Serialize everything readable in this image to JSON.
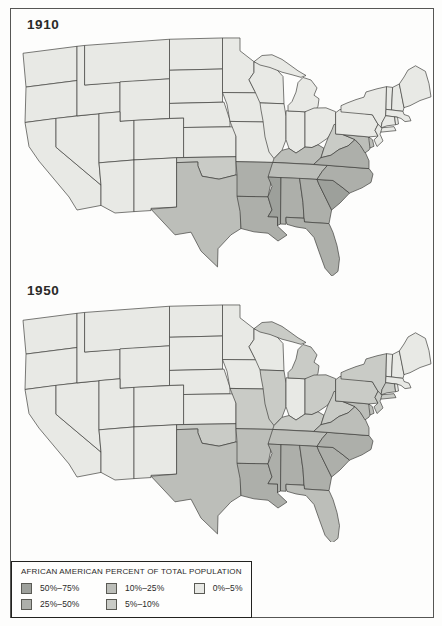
{
  "figure": {
    "type": "choropleth-map-pair",
    "region": "contiguous United States"
  },
  "colors": {
    "c50_75": "#9da09b",
    "c25_50": "#adafaa",
    "c10_25": "#bcbeb9",
    "c5_10": "#c9cbc6",
    "c0_5": "#e8e9e5",
    "border": "#3b3b39",
    "frame": "#565654",
    "background": "#fdfdfc"
  },
  "legend": {
    "title": "AFRICAN AMERICAN PERCENT OF TOTAL POPULATION",
    "items": [
      {
        "label": "50%–75%",
        "category": "c50_75"
      },
      {
        "label": "25%–50%",
        "category": "c25_50"
      },
      {
        "label": "10%–25%",
        "category": "c10_25"
      },
      {
        "label": "5%–10%",
        "category": "c5_10"
      },
      {
        "label": "0%–5%",
        "category": "c0_5"
      }
    ]
  },
  "maps": [
    {
      "id": "m1910",
      "year": "1910",
      "default_category": "c0_5",
      "state_categories": {
        "MS": "c50_75",
        "SC": "c50_75",
        "LA": "c25_50",
        "AL": "c25_50",
        "GA": "c25_50",
        "FL": "c25_50",
        "NC": "c25_50",
        "VA": "c25_50",
        "AR": "c25_50",
        "TX": "c10_25",
        "TN": "c10_25",
        "KY": "c10_25",
        "MD": "c10_25",
        "DE": "c10_25",
        "OK": "c5_10",
        "WV": "c5_10"
      }
    },
    {
      "id": "m1950",
      "year": "1950",
      "default_category": "c0_5",
      "state_categories": {
        "MS": "c25_50",
        "SC": "c25_50",
        "LA": "c25_50",
        "AL": "c25_50",
        "GA": "c25_50",
        "NC": "c25_50",
        "VA": "c10_25",
        "FL": "c10_25",
        "AR": "c10_25",
        "TN": "c10_25",
        "TX": "c10_25",
        "MD": "c10_25",
        "DE": "c10_25",
        "OK": "c5_10",
        "KY": "c5_10",
        "WV": "c5_10",
        "MO": "c5_10",
        "IL": "c5_10",
        "OH": "c5_10",
        "MI": "c5_10",
        "NY": "c5_10",
        "NJ": "c5_10",
        "PA": "c5_10",
        "CT": "c5_10"
      }
    }
  ]
}
